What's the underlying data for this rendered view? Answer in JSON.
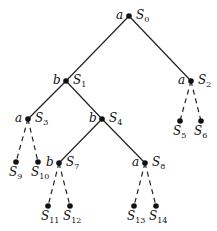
{
  "diagram": {
    "type": "game-tree",
    "nodes": [
      {
        "id": "S0",
        "name": "S",
        "sub": "0",
        "player": "a",
        "x": 129,
        "y": 16,
        "label_pos": "right-top",
        "player_pos": "left"
      },
      {
        "id": "S1",
        "name": "S",
        "sub": "1",
        "player": "b",
        "x": 66,
        "y": 81,
        "label_pos": "right-top",
        "player_pos": "left"
      },
      {
        "id": "S2",
        "name": "S",
        "sub": "2",
        "player": "a",
        "x": 191,
        "y": 81,
        "label_pos": "right-top",
        "player_pos": "left"
      },
      {
        "id": "S3",
        "name": "S",
        "sub": "3",
        "player": "a",
        "x": 28,
        "y": 119,
        "label_pos": "right-top",
        "player_pos": "left"
      },
      {
        "id": "S4",
        "name": "S",
        "sub": "4",
        "player": "b",
        "x": 102,
        "y": 119,
        "label_pos": "right-top",
        "player_pos": "left"
      },
      {
        "id": "S5",
        "name": "S",
        "sub": "5",
        "player": "",
        "x": 180,
        "y": 121,
        "label_pos": "below"
      },
      {
        "id": "S6",
        "name": "S",
        "sub": "6",
        "player": "",
        "x": 201,
        "y": 121,
        "label_pos": "below"
      },
      {
        "id": "S7",
        "name": "S",
        "sub": "7",
        "player": "b",
        "x": 59,
        "y": 163,
        "label_pos": "right-top",
        "player_pos": "left"
      },
      {
        "id": "S8",
        "name": "S",
        "sub": "8",
        "player": "a",
        "x": 145,
        "y": 163,
        "label_pos": "right-top",
        "player_pos": "left"
      },
      {
        "id": "S9",
        "name": "S",
        "sub": "9",
        "player": "",
        "x": 16,
        "y": 162,
        "label_pos": "below"
      },
      {
        "id": "S10",
        "name": "S",
        "sub": "10",
        "player": "",
        "x": 38,
        "y": 162,
        "label_pos": "below"
      },
      {
        "id": "S11",
        "name": "S",
        "sub": "11",
        "player": "",
        "x": 48,
        "y": 206,
        "label_pos": "below"
      },
      {
        "id": "S12",
        "name": "S",
        "sub": "12",
        "player": "",
        "x": 70,
        "y": 206,
        "label_pos": "below"
      },
      {
        "id": "S13",
        "name": "S",
        "sub": "13",
        "player": "",
        "x": 134,
        "y": 206,
        "label_pos": "below"
      },
      {
        "id": "S14",
        "name": "S",
        "sub": "14",
        "player": "",
        "x": 156,
        "y": 206,
        "label_pos": "below"
      }
    ],
    "edges": [
      {
        "from": "S0",
        "to": "S1",
        "style": "solid"
      },
      {
        "from": "S0",
        "to": "S2",
        "style": "solid"
      },
      {
        "from": "S1",
        "to": "S3",
        "style": "solid"
      },
      {
        "from": "S1",
        "to": "S4",
        "style": "solid"
      },
      {
        "from": "S2",
        "to": "S5",
        "style": "dashed"
      },
      {
        "from": "S2",
        "to": "S6",
        "style": "dashed"
      },
      {
        "from": "S3",
        "to": "S9",
        "style": "dashed"
      },
      {
        "from": "S3",
        "to": "S10",
        "style": "dashed"
      },
      {
        "from": "S4",
        "to": "S7",
        "style": "solid"
      },
      {
        "from": "S4",
        "to": "S8",
        "style": "solid"
      },
      {
        "from": "S7",
        "to": "S11",
        "style": "dashed"
      },
      {
        "from": "S7",
        "to": "S12",
        "style": "dashed"
      },
      {
        "from": "S8",
        "to": "S13",
        "style": "dashed"
      },
      {
        "from": "S8",
        "to": "S14",
        "style": "dashed"
      }
    ],
    "colors": {
      "line": "#222222",
      "node": "#111111",
      "text": "#111111",
      "background": "#ffffff"
    }
  }
}
